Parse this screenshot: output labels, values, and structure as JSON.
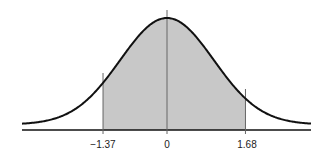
{
  "chart_data": {
    "type": "area",
    "title": "",
    "xlabel": "",
    "ylabel": "",
    "distribution": "standard normal",
    "shaded_region": {
      "from": -1.37,
      "to": 1.68
    },
    "tick_labels": [
      "−1.37",
      "0",
      "1.68"
    ],
    "tick_values": [
      -1.37,
      0,
      1.68
    ],
    "xlim": [
      -3.1,
      3.1
    ],
    "grid": false,
    "colors": {
      "fill": "#c8c8c8",
      "curve": "#111111",
      "lines": "#555555"
    }
  },
  "labels": {
    "t0": "−1.37",
    "t1": "0",
    "t2": "1.68"
  }
}
